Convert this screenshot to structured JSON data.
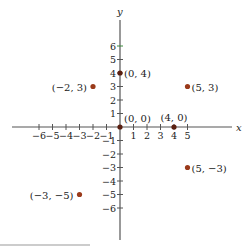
{
  "diagram": {
    "type": "cartesian-plane",
    "origin_px": [
      120,
      127
    ],
    "unit_px": 13.5,
    "axes": {
      "x_label": "x",
      "y_label": "y",
      "x_ticks": [
        -6,
        -5,
        -4,
        -3,
        -2,
        -1,
        1,
        2,
        3,
        4,
        5
      ],
      "y_ticks": [
        6,
        5,
        4,
        3,
        2,
        1,
        -1,
        -2,
        -3,
        -4,
        -5,
        -6
      ],
      "axis_color": "#555555",
      "highlight_tick_color": "#3a8a3a"
    },
    "points": [
      {
        "x": 0,
        "y": 4,
        "label": "(0, 4)",
        "color": "#5a1f10"
      },
      {
        "x": -2,
        "y": 3,
        "label": "(−2, 3)",
        "color": "#9a3a1a"
      },
      {
        "x": 5,
        "y": 3,
        "label": "(5, 3)",
        "color": "#9a3a1a"
      },
      {
        "x": 0,
        "y": 0,
        "label": "(0, 0)",
        "color": "#5a1f10"
      },
      {
        "x": 4,
        "y": 0,
        "label": "(4, 0)",
        "color": "#5a1f10"
      },
      {
        "x": 5,
        "y": -3,
        "label": "(5, −3)",
        "color": "#9a3a1a"
      },
      {
        "x": -3,
        "y": -5,
        "label": "(−3, −5)",
        "color": "#9a3a1a"
      }
    ],
    "footer_rule": {
      "x1": 0,
      "x2": 90,
      "y": 245,
      "color": "#999999"
    }
  }
}
